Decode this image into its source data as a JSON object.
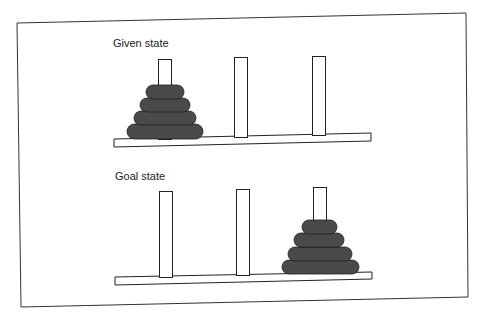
{
  "figure": {
    "frame": {
      "points": "17,23 466,13 468,297 21,307"
    },
    "disk_color": "#4a4a4a",
    "panels": [
      {
        "label": "Given state",
        "label_pos": {
          "x": 113,
          "y": 47
        },
        "base": {
          "points": "114,139 371,133 371,141 114,147"
        },
        "pegs": [
          {
            "name": "peg-1",
            "x": 158,
            "top": 59,
            "width": 13,
            "bottom": 139
          },
          {
            "name": "peg-2",
            "x": 234,
            "top": 57,
            "width": 13,
            "bottom": 137
          },
          {
            "name": "peg-3",
            "x": 312,
            "top": 56,
            "width": 13,
            "bottom": 135
          }
        ],
        "disks": [
          {
            "size": 4,
            "peg": 1,
            "x": 127,
            "y": 124,
            "w": 76,
            "h": 15
          },
          {
            "size": 3,
            "peg": 1,
            "x": 134,
            "y": 111,
            "w": 62,
            "h": 14
          },
          {
            "size": 2,
            "peg": 1,
            "x": 140,
            "y": 98,
            "w": 50,
            "h": 14
          },
          {
            "size": 1,
            "peg": 1,
            "x": 146,
            "y": 85,
            "w": 38,
            "h": 14
          }
        ]
      },
      {
        "label": "Goal state",
        "label_pos": {
          "x": 115,
          "y": 180
        },
        "base": {
          "points": "115,277 372,272 372,279 115,285"
        },
        "pegs": [
          {
            "name": "peg-1",
            "x": 159,
            "top": 191,
            "width": 13,
            "bottom": 277
          },
          {
            "name": "peg-2",
            "x": 236,
            "top": 189,
            "width": 13,
            "bottom": 275
          },
          {
            "name": "peg-3",
            "x": 313,
            "top": 187,
            "width": 13,
            "bottom": 273
          }
        ],
        "disks": [
          {
            "size": 4,
            "peg": 3,
            "x": 282,
            "y": 260,
            "w": 77,
            "h": 14
          },
          {
            "size": 3,
            "peg": 3,
            "x": 288,
            "y": 247,
            "w": 64,
            "h": 14
          },
          {
            "size": 2,
            "peg": 3,
            "x": 294,
            "y": 233,
            "w": 50,
            "h": 14
          },
          {
            "size": 1,
            "peg": 3,
            "x": 302,
            "y": 220,
            "w": 35,
            "h": 14
          }
        ]
      }
    ]
  }
}
